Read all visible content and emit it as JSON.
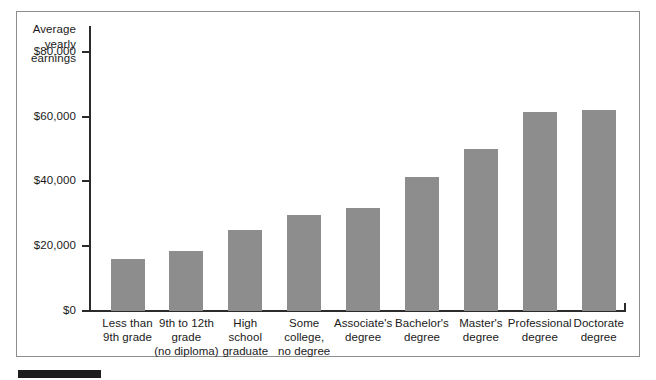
{
  "figure": {
    "name": "average-yearly-earnings-by-education-bar-chart",
    "bottom_rule_label": ""
  },
  "chart_data": {
    "type": "bar",
    "title": "",
    "xlabel": "",
    "ylabel": "Average\nyearly\nearnings",
    "ylabel_lines": [
      "Average",
      "yearly",
      "earnings"
    ],
    "categories": [
      "Less than\n9th grade",
      "9th to 12th\ngrade\n(no diploma)",
      "High\nschool\ngraduate",
      "Some\ncollege,\nno degree",
      "Associate's\ndegree",
      "Bachelor's\ndegree",
      "Master's\ndegree",
      "Professional\ndegree",
      "Doctorate\ndegree"
    ],
    "values": [
      16200,
      18400,
      25000,
      29500,
      31700,
      41300,
      50100,
      61500,
      62200
    ],
    "ylim": [
      0,
      88000
    ],
    "yticks": [
      0,
      20000,
      40000,
      60000,
      80000
    ],
    "ytick_labels": [
      "$0",
      "$20,000",
      "$40,000",
      "$60,000",
      "$80,000"
    ],
    "grid": false,
    "legend": null,
    "bar_color": "#8d8d8d",
    "axis_color": "#2b2b2b",
    "frame_color": "#8d8d8d",
    "background_color": "#ffffff"
  }
}
